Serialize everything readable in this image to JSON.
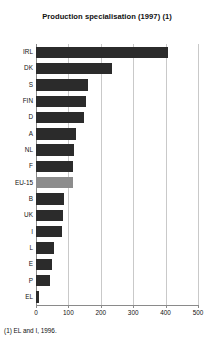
{
  "chart_data": {
    "type": "bar",
    "orientation": "horizontal",
    "title": "Production specialisation (1997) (1)",
    "xlabel": "",
    "ylabel": "",
    "xlim": [
      0,
      500
    ],
    "ylim": null,
    "grid": true,
    "legend": null,
    "xticks": [
      0,
      100,
      200,
      300,
      400,
      500
    ],
    "xtick_labels": [
      "0",
      "100",
      "200",
      "300",
      "400",
      "500"
    ],
    "categories": [
      "IRL",
      "DK",
      "S",
      "FIN",
      "D",
      "A",
      "NL",
      "F",
      "EU-15",
      "B",
      "UK",
      "I",
      "L",
      "E",
      "P",
      "EL"
    ],
    "values": [
      407,
      235,
      160,
      154,
      148,
      123,
      117,
      114,
      114,
      86,
      84,
      80,
      55,
      49,
      43,
      9
    ],
    "annotations": [
      "(1) EL and I, 1996."
    ],
    "highlight_category": "EU-15",
    "colors": {
      "bar": "#2b2b2b",
      "highlight_bar": "#8c8c8c",
      "grid": "#c9c9c9",
      "axis": "#8a8a8a",
      "text": "#111111",
      "background": "#ffffff"
    }
  },
  "footnote": "(1) EL and I, 1996."
}
